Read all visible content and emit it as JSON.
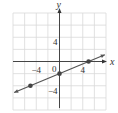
{
  "chart_data": {
    "type": "line",
    "title": "",
    "xlabel": "x",
    "ylabel": "y",
    "xlim": [
      -8,
      8
    ],
    "ylim": [
      -8,
      8
    ],
    "grid": true,
    "grid_step": 2,
    "tick_labels": {
      "x": [
        {
          "value": -4,
          "label": "−4"
        },
        {
          "value": 4,
          "label": "4"
        }
      ],
      "y": [
        {
          "value": 4,
          "label": "4"
        },
        {
          "value": -4,
          "label": "−4"
        }
      ],
      "origin": "0"
    },
    "series": [
      {
        "name": "line",
        "equation": "y = (2/5)x - 2",
        "points": [
          {
            "x": -5,
            "y": -4
          },
          {
            "x": 0,
            "y": -2
          },
          {
            "x": 5,
            "y": 0
          }
        ],
        "x_range": [
          -8,
          8
        ]
      }
    ],
    "colors": {
      "grid": "#d9d9d9",
      "axis": "#333333",
      "line": "#555555",
      "point": "#444444"
    }
  }
}
